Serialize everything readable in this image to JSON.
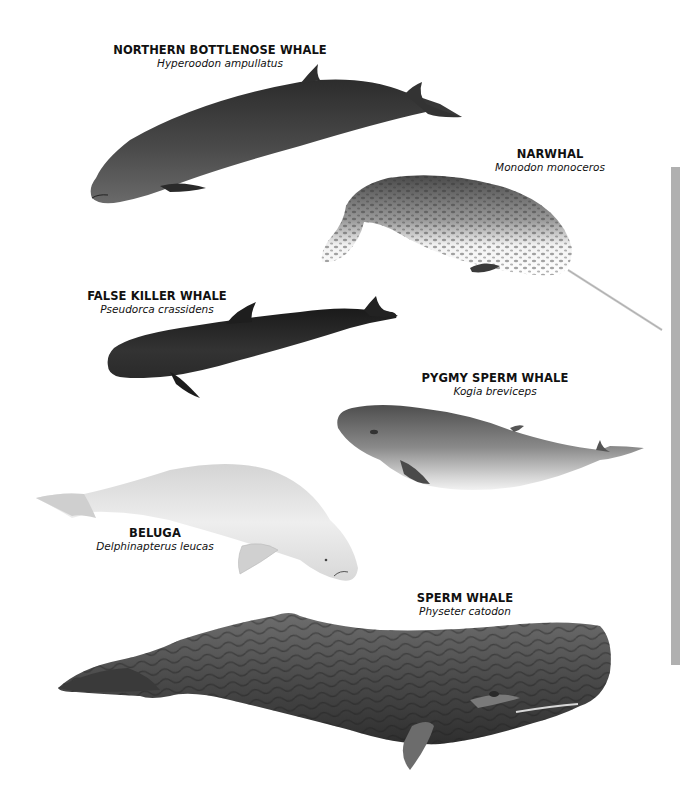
{
  "page": {
    "background": "#ffffff",
    "edge_bar_color": "#b0b0b0"
  },
  "species": [
    {
      "id": "northern-bottlenose-whale",
      "common_name": "NORTHERN BOTTLENOSE WHALE",
      "scientific_name": "Hyperoodon ampullatus",
      "tone": "#3e3e3e"
    },
    {
      "id": "narwhal",
      "common_name": "NARWHAL",
      "scientific_name": "Monodon monoceros",
      "tone": "#6a6a6a"
    },
    {
      "id": "false-killer-whale",
      "common_name": "FALSE KILLER WHALE",
      "scientific_name": "Pseudorca crassidens",
      "tone": "#2a2a2a"
    },
    {
      "id": "pygmy-sperm-whale",
      "common_name": "PYGMY SPERM WHALE",
      "scientific_name": "Kogia breviceps",
      "tone": "#7a7a7a"
    },
    {
      "id": "beluga",
      "common_name": "BELUGA",
      "scientific_name": "Delphinapterus leucas",
      "tone": "#e6e6e6"
    },
    {
      "id": "sperm-whale",
      "common_name": "SPERM WHALE",
      "scientific_name": "Physeter catodon",
      "tone": "#555555"
    }
  ]
}
